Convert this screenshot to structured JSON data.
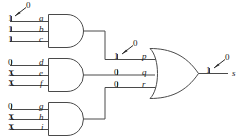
{
  "figure": {
    "kind": "logic-circuit-diagram",
    "line_color": "#4a4a4a",
    "text_color": "#1a1a1a",
    "background_color": "#ffffff"
  },
  "and_gate_1": {
    "name": "and-gate-top",
    "inputs": [
      {
        "label": "a",
        "value": "1",
        "annotation": "0"
      },
      {
        "label": "b",
        "value": "1",
        "annotation": ""
      },
      {
        "label": "c",
        "value": "1",
        "annotation": ""
      }
    ]
  },
  "and_gate_2": {
    "name": "and-gate-middle",
    "inputs": [
      {
        "label": "d",
        "value": "0",
        "annotation": ""
      },
      {
        "label": "e",
        "value": "X",
        "annotation": ""
      },
      {
        "label": "f",
        "value": "X",
        "annotation": ""
      }
    ]
  },
  "and_gate_3": {
    "name": "and-gate-bottom",
    "inputs": [
      {
        "label": "g",
        "value": "0",
        "annotation": ""
      },
      {
        "label": "h",
        "value": "X",
        "annotation": ""
      },
      {
        "label": "i",
        "value": "X",
        "annotation": ""
      }
    ]
  },
  "or_gate": {
    "name": "or-gate",
    "inputs": [
      {
        "label": "p",
        "value": "1",
        "annotation": "0"
      },
      {
        "label": "q",
        "value": "0",
        "annotation": ""
      },
      {
        "label": "r",
        "value": "0",
        "annotation": ""
      }
    ],
    "output": {
      "label": "s",
      "value": "1",
      "annotation": "0"
    }
  }
}
